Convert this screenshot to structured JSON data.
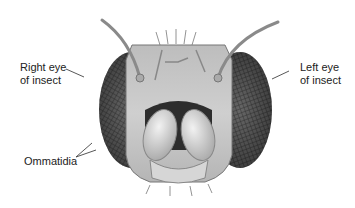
{
  "figure": {
    "labels": {
      "right_eye_line1": "Right eye",
      "right_eye_line2": "of insect",
      "left_eye_line1": "Left eye",
      "left_eye_line2": "of insect",
      "ommatidia": "Ommatidia"
    }
  }
}
